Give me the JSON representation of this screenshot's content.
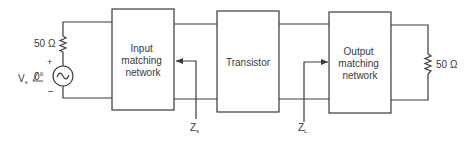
{
  "diagram": {
    "type": "circuit-block-diagram",
    "colors": {
      "line": "#3a3a3a",
      "background": "#ffffff"
    },
    "source": {
      "resistor_label": "50 Ω",
      "voltage_label": "V",
      "voltage_subscript": "s",
      "phase_label": "0°",
      "plus": "+",
      "minus": "−",
      "symbol": "~"
    },
    "blocks": [
      {
        "id": "input",
        "lines": [
          "Input",
          "matching",
          "network"
        ]
      },
      {
        "id": "transistor",
        "lines": [
          "Transistor"
        ]
      },
      {
        "id": "output",
        "lines": [
          "Output",
          "matching",
          "network"
        ]
      }
    ],
    "load": {
      "resistor_label": "50 Ω"
    },
    "impedances": {
      "source": {
        "label": "Z",
        "subscript": "s"
      },
      "load": {
        "label": "Z",
        "subscript": "L"
      }
    }
  }
}
